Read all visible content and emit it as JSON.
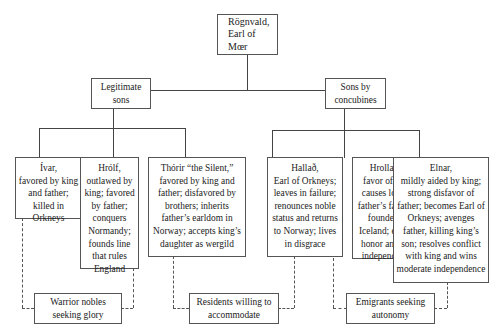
{
  "diagram": {
    "root": {
      "line1": "Rögnvald,",
      "line2": "Earl of Mœr"
    },
    "groups": [
      {
        "label_line1": "Legitimate",
        "label_line2": "sons"
      },
      {
        "label_line1": "Sons by",
        "label_line2": "concubines"
      }
    ],
    "sons": [
      {
        "name": "Ívar,",
        "desc": "favored by king and father; killed in Orkneys"
      },
      {
        "name": "Hrólf,",
        "desc": "outlawed by king; favored by father; conquers Normandy; founds line that rules England"
      },
      {
        "name": "Thórir “the Silent,”",
        "desc": "favored by king and father; disfavored by brothers; inherits father’s earldom in Norway; accepts king’s daughter as wergild"
      },
      {
        "name": "Hallað,",
        "desc": "Earl of Orkneys; leaves in failure; renounces noble status and returns to Norway; lives in disgrace"
      },
      {
        "name": "Hrollaug,",
        "desc": "favor of king causes loss of father’s favor; a founder of Iceland; enjoys honor and full independence"
      },
      {
        "name": "Elnar,",
        "desc": "mildly aided by king; strong disfavor of father; becomes Earl of Orkneys; avenges father, killing king’s son; resolves conflict with king and wins moderate independence"
      }
    ],
    "categories": [
      {
        "line1": "Warrior nobles",
        "line2": "seeking glory"
      },
      {
        "line1": "Residents willing to",
        "line2": "accommodate"
      },
      {
        "line1": "Emigrants seeking",
        "line2": "autonomy"
      }
    ]
  }
}
